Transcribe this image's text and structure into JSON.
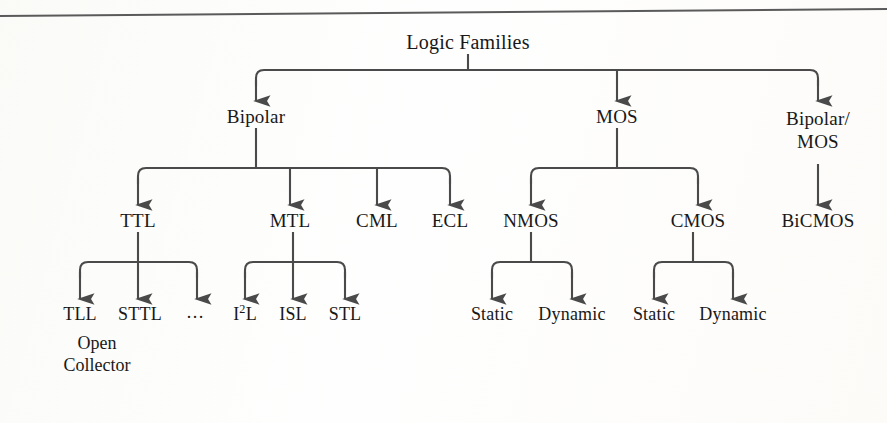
{
  "figure": {
    "title": "Logic Families",
    "top_rule": true
  },
  "tree": {
    "root": {
      "label": "Logic Families",
      "x": 468,
      "y": 34
    },
    "level1": [
      {
        "id": "bipolar",
        "label": "Bipolar",
        "x": 256,
        "y": 118
      },
      {
        "id": "mos",
        "label": "MOS",
        "x": 617,
        "y": 118
      },
      {
        "id": "bipolar-mos",
        "label": "Bipolar/\nMOS",
        "line1": "Bipolar/",
        "line2": "MOS",
        "x": 818,
        "y": 118
      }
    ],
    "level2": [
      {
        "id": "ttl",
        "label": "TTL",
        "x": 138,
        "y": 222
      },
      {
        "id": "mtl",
        "label": "MTL",
        "x": 290,
        "y": 222
      },
      {
        "id": "cml",
        "label": "CML",
        "x": 377,
        "y": 222
      },
      {
        "id": "ecl",
        "label": "ECL",
        "x": 450,
        "y": 222
      },
      {
        "id": "nmos",
        "label": "NMOS",
        "x": 531,
        "y": 222
      },
      {
        "id": "cmos",
        "label": "CMOS",
        "x": 698,
        "y": 222
      },
      {
        "id": "bicmos",
        "label": "BiCMOS",
        "x": 818,
        "y": 222
      }
    ],
    "level3": [
      {
        "id": "tll",
        "label": "TLL",
        "x": 80,
        "y": 315
      },
      {
        "id": "sttl",
        "label": "STTL",
        "x": 140,
        "y": 315
      },
      {
        "id": "ttl-more",
        "label": "…",
        "x": 196,
        "y": 315
      },
      {
        "id": "i2l",
        "label": "I2L",
        "base": "I",
        "sup": "2",
        "tail": "L",
        "x": 245,
        "y": 315
      },
      {
        "id": "isl",
        "label": "ISL",
        "x": 293,
        "y": 315
      },
      {
        "id": "stl",
        "label": "STL",
        "x": 345,
        "y": 315
      },
      {
        "id": "nmos-static",
        "label": "Static",
        "x": 492,
        "y": 315
      },
      {
        "id": "nmos-dynamic",
        "label": "Dynamic",
        "x": 572,
        "y": 315
      },
      {
        "id": "cmos-static",
        "label": "Static",
        "x": 654,
        "y": 315
      },
      {
        "id": "cmos-dynamic",
        "label": "Dynamic",
        "x": 733,
        "y": 315
      }
    ],
    "annotations": [
      {
        "id": "open-collector",
        "line1": "Open",
        "line2": "Collector",
        "x": 42,
        "y": 336
      }
    ]
  },
  "edges": {
    "root_children": [
      "Bipolar",
      "MOS",
      "Bipolar/MOS"
    ],
    "bipolar_children": [
      "TTL",
      "MTL",
      "CML",
      "ECL"
    ],
    "mos_children": [
      "NMOS",
      "CMOS"
    ],
    "bipolar_mos_children": [
      "BiCMOS"
    ],
    "ttl_children": [
      "TLL",
      "STTL",
      "…"
    ],
    "mtl_children": [
      "I2L",
      "ISL",
      "STL"
    ],
    "nmos_children": [
      "Static",
      "Dynamic"
    ],
    "cmos_children": [
      "Static",
      "Dynamic"
    ]
  },
  "style": {
    "ink": "#4a4a4a",
    "text": "#181818",
    "paper": "#fdfdfc"
  }
}
